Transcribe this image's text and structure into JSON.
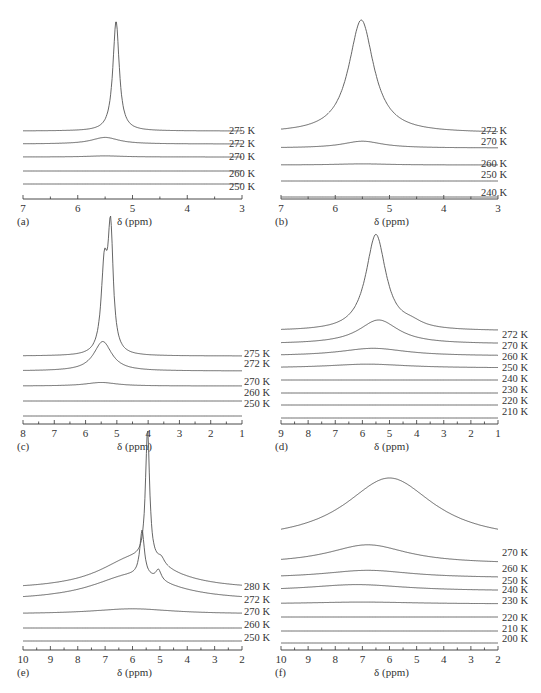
{
  "chart_data": [
    {
      "type": "line",
      "panel": "(a)",
      "xlabel": "δ (ppm)",
      "xlim": [
        7,
        3
      ],
      "xticks": [
        7,
        6,
        5,
        4,
        3
      ],
      "series": [
        {
          "name": "275 K",
          "peaks": [
            {
              "center": 5.3,
              "height": 1.0,
              "width": 0.07
            }
          ]
        },
        {
          "name": "272 K",
          "peaks": [
            {
              "center": 5.5,
              "height": 0.06,
              "width": 0.3
            }
          ]
        },
        {
          "name": "270 K",
          "peaks": [
            {
              "center": 5.5,
              "height": 0.01,
              "width": 0.4
            }
          ]
        },
        {
          "name": "260 K",
          "peaks": []
        },
        {
          "name": "250 K",
          "peaks": []
        }
      ]
    },
    {
      "type": "line",
      "panel": "(b)",
      "xlabel": "δ (ppm)",
      "xlim": [
        7,
        3
      ],
      "xticks": [
        7,
        6,
        5,
        4,
        3
      ],
      "series": [
        {
          "name": "272 K",
          "peaks": [
            {
              "center": 5.52,
              "height": 1.0,
              "width": 0.28
            }
          ]
        },
        {
          "name": "270 K",
          "peaks": [
            {
              "center": 5.5,
              "height": 0.06,
              "width": 0.45
            }
          ]
        },
        {
          "name": "260 K",
          "peaks": [
            {
              "center": 5.5,
              "height": 0.01,
              "width": 0.6
            }
          ]
        },
        {
          "name": "250 K",
          "peaks": []
        },
        {
          "name": "240 K",
          "peaks": []
        }
      ]
    },
    {
      "type": "line",
      "panel": "(c)",
      "xlabel": "δ (ppm)",
      "xlim": [
        8,
        1
      ],
      "xticks": [
        8,
        7,
        6,
        5,
        4,
        3,
        2,
        1
      ],
      "series": [
        {
          "name": "275 K",
          "peaks": [
            {
              "center": 5.4,
              "height": 0.7,
              "width": 0.12
            },
            {
              "center": 5.2,
              "height": 1.0,
              "width": 0.1
            }
          ]
        },
        {
          "name": "272 K",
          "peaks": [
            {
              "center": 5.45,
              "height": 0.25,
              "width": 0.35
            }
          ]
        },
        {
          "name": "270 K",
          "peaks": [
            {
              "center": 5.5,
              "height": 0.03,
              "width": 0.6
            }
          ]
        },
        {
          "name": "260 K",
          "peaks": []
        },
        {
          "name": "250 K",
          "peaks": []
        }
      ]
    },
    {
      "type": "line",
      "panel": "(d)",
      "xlabel": "δ (ppm)",
      "xlim": [
        9,
        1
      ],
      "xticks": [
        9,
        8,
        7,
        6,
        5,
        4,
        3,
        2,
        1
      ],
      "series": [
        {
          "name": "272 K",
          "peaks": [
            {
              "center": 5.5,
              "height": 1.0,
              "width": 0.45
            },
            {
              "center": 4.2,
              "height": 0.05,
              "width": 0.5
            }
          ]
        },
        {
          "name": "270 K",
          "peaks": [
            {
              "center": 5.4,
              "height": 0.25,
              "width": 0.9
            }
          ]
        },
        {
          "name": "260 K",
          "peaks": [
            {
              "center": 5.6,
              "height": 0.08,
              "width": 1.5
            }
          ]
        },
        {
          "name": "250 K",
          "peaks": [
            {
              "center": 5.8,
              "height": 0.04,
              "width": 1.8
            }
          ]
        },
        {
          "name": "240 K",
          "peaks": []
        },
        {
          "name": "230 K",
          "peaks": []
        },
        {
          "name": "220 K",
          "peaks": []
        },
        {
          "name": "210 K",
          "peaks": []
        }
      ]
    },
    {
      "type": "line",
      "panel": "(e)",
      "xlabel": "δ (ppm)",
      "xlim": [
        10,
        2
      ],
      "xticks": [
        10,
        9,
        8,
        7,
        6,
        5,
        4,
        3,
        2
      ],
      "series": [
        {
          "name": "280 K",
          "peaks": [
            {
              "center": 5.45,
              "height": 1.0,
              "width": 0.09
            },
            {
              "center": 5.9,
              "height": 0.25,
              "width": 1.6
            },
            {
              "center": 4.95,
              "height": 0.05,
              "width": 0.15
            }
          ]
        },
        {
          "name": "272 K",
          "peaks": [
            {
              "center": 5.65,
              "height": 0.35,
              "width": 0.1
            },
            {
              "center": 6.0,
              "height": 0.2,
              "width": 1.8
            },
            {
              "center": 5.05,
              "height": 0.08,
              "width": 0.12
            }
          ]
        },
        {
          "name": "270 K",
          "peaks": [
            {
              "center": 6.0,
              "height": 0.04,
              "width": 1.8
            }
          ]
        },
        {
          "name": "260 K",
          "peaks": []
        },
        {
          "name": "250 K",
          "peaks": []
        }
      ]
    },
    {
      "type": "line",
      "panel": "(f)",
      "xlabel": "δ (ppm)",
      "xlim": [
        10,
        2
      ],
      "xticks": [
        10,
        9,
        8,
        7,
        6,
        5,
        4,
        3,
        2
      ],
      "series": [
        {
          "name": "270 K",
          "peaks": [
            {
              "center": 6.0,
              "height": 1.0,
              "width": 2.0
            }
          ]
        },
        {
          "name": "260 K",
          "peaks": [
            {
              "center": 6.8,
              "height": 0.3,
              "width": 1.8
            }
          ]
        },
        {
          "name": "250 K",
          "peaks": [
            {
              "center": 6.8,
              "height": 0.12,
              "width": 2.0
            }
          ]
        },
        {
          "name": "240 K",
          "peaks": [
            {
              "center": 7.2,
              "height": 0.1,
              "width": 2.2
            }
          ]
        },
        {
          "name": "230 K",
          "peaks": [
            {
              "center": 7.0,
              "height": 0.03,
              "width": 2.5
            }
          ]
        },
        {
          "name": "220 K",
          "peaks": []
        },
        {
          "name": "210 K",
          "peaks": []
        },
        {
          "name": "200 K",
          "peaks": []
        }
      ]
    }
  ]
}
